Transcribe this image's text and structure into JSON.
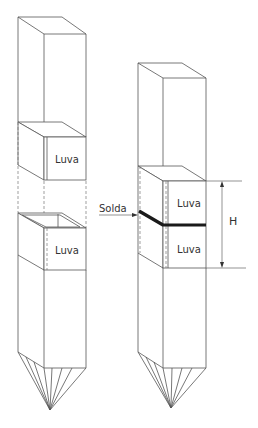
{
  "figure": {
    "left_pile": {
      "upper_sleeve_label": "Luva",
      "lower_sleeve_label": "Luva"
    },
    "right_pile": {
      "upper_sleeve_label": "Luva",
      "lower_sleeve_label": "Luva",
      "weld_label": "Solda",
      "dimension_label": "H"
    },
    "colors": {
      "line": "#555555",
      "weld": "#1a1a1a",
      "background": "#ffffff"
    }
  }
}
